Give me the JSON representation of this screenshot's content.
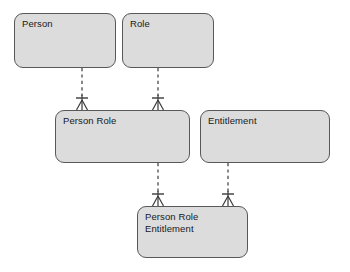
{
  "diagram": {
    "type": "entity-relationship-diagram",
    "notation": "crow's foot",
    "canvas": {
      "width": 350,
      "height": 272,
      "background": "#ffffff"
    },
    "style": {
      "entity_fill": "#dcdcdc",
      "entity_border": "#58585a",
      "connector_color": "#3a3a3c",
      "text_color": "#18181a",
      "connector_style": "dashed"
    },
    "entities": [
      {
        "id": "person",
        "label": "Person",
        "x": 14,
        "y": 13,
        "w": 102,
        "h": 55
      },
      {
        "id": "role",
        "label": "Role",
        "x": 122,
        "y": 13,
        "w": 92,
        "h": 55
      },
      {
        "id": "person-role",
        "label": "Person Role",
        "x": 55,
        "y": 110,
        "w": 135,
        "h": 53
      },
      {
        "id": "entitlement",
        "label": "Entitlement",
        "x": 200,
        "y": 110,
        "w": 130,
        "h": 53
      },
      {
        "id": "person-role-entitlement",
        "label": "Person Role\nEntitlement",
        "x": 137,
        "y": 206,
        "w": 111,
        "h": 52
      }
    ],
    "relationships": [
      {
        "id": "person-to-person-role",
        "from": "person",
        "to": "person-role",
        "from_cardinality": "one",
        "to_cardinality": "many",
        "x": 82,
        "y1": 68,
        "y2": 110
      },
      {
        "id": "role-to-person-role",
        "from": "role",
        "to": "person-role",
        "from_cardinality": "one",
        "to_cardinality": "many",
        "x": 158,
        "y1": 68,
        "y2": 110
      },
      {
        "id": "person-role-to-person-role-entitlement",
        "from": "person-role",
        "to": "person-role-entitlement",
        "from_cardinality": "one",
        "to_cardinality": "many",
        "x": 158,
        "y1": 163,
        "y2": 206
      },
      {
        "id": "entitlement-to-person-role-entitlement",
        "from": "entitlement",
        "to": "person-role-entitlement",
        "from_cardinality": "one",
        "to_cardinality": "many",
        "x": 228,
        "y1": 163,
        "y2": 206
      }
    ]
  }
}
